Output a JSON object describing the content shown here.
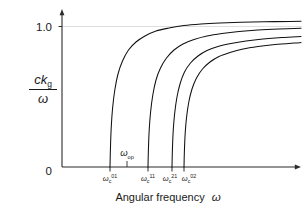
{
  "figure": {
    "background": "#ffffff",
    "ink_color": "#111111",
    "grid_color": "#dedede"
  },
  "chart_data": {
    "type": "line",
    "title": "",
    "xlabel": "Angular frequency  ω",
    "ylabel_numerator": "ck",
    "ylabel_numerator_sub": "g",
    "ylabel_denominator": "ω",
    "ylabel_plain": "ck_g / ω",
    "grid": "horizontal-at-1.0",
    "legend": "none",
    "xlim": [
      0,
      1
    ],
    "ylim": [
      0,
      1.12
    ],
    "y_ticks": [
      {
        "value": 1.0,
        "label": "1.0"
      },
      {
        "value": 0.0,
        "label": "0"
      }
    ],
    "x_ticks": [
      {
        "label_base": "ω",
        "label_sub": "c",
        "label_sup": "01",
        "plain": "ω_c^01",
        "x_px": 110
      },
      {
        "label_base": "ω",
        "label_sub": "c",
        "label_sup": "11",
        "plain": "ω_c^11",
        "x_px": 148
      },
      {
        "label_base": "ω",
        "label_sub": "c",
        "label_sup": "21",
        "plain": "ω_c^21",
        "x_px": 172
      },
      {
        "label_base": "ω",
        "label_sub": "c",
        "label_sup": "02",
        "plain": "ω_c^02",
        "x_px": 184
      }
    ],
    "annotations": [
      {
        "name": "operating-frequency-marker",
        "base": "ω",
        "sub": "op",
        "plain": "ω_op",
        "x_px": 127,
        "label_y_px": 155,
        "tick_top_px": 161,
        "tick_bottom_px": 167
      }
    ],
    "series": [
      {
        "name": "TE01 mode",
        "cutoff_label": "ω_c^01",
        "cutoff_x_px": 110,
        "asymptote": 1.0,
        "points": [
          [
            110,
            167
          ],
          [
            110.4,
            150
          ],
          [
            111.2,
            128
          ],
          [
            112.6,
            108
          ],
          [
            114.8,
            90
          ],
          [
            118,
            74
          ],
          [
            122.5,
            61
          ],
          [
            128.5,
            50
          ],
          [
            136,
            42
          ],
          [
            145,
            36
          ],
          [
            156,
            31
          ],
          [
            169,
            28
          ],
          [
            184,
            25.5
          ],
          [
            201,
            24
          ],
          [
            220,
            23
          ],
          [
            241,
            22.3
          ],
          [
            264,
            21.8
          ],
          [
            290,
            21.4
          ],
          [
            301,
            21.3
          ]
        ]
      },
      {
        "name": "TE11 mode",
        "cutoff_label": "ω_c^11",
        "cutoff_x_px": 148,
        "asymptote": 1.0,
        "points": [
          [
            148,
            167
          ],
          [
            148.4,
            150
          ],
          [
            149.2,
            130
          ],
          [
            150.6,
            112
          ],
          [
            152.8,
            95
          ],
          [
            156,
            80
          ],
          [
            160.5,
            68
          ],
          [
            166.5,
            58
          ],
          [
            174,
            50
          ],
          [
            183,
            44
          ],
          [
            194,
            39.5
          ],
          [
            207,
            36
          ],
          [
            222,
            33.5
          ],
          [
            239,
            31.5
          ],
          [
            258,
            30
          ],
          [
            279,
            29
          ],
          [
            301,
            28.3
          ]
        ]
      },
      {
        "name": "TE21 mode",
        "cutoff_label": "ω_c^21",
        "cutoff_x_px": 172,
        "asymptote": 1.0,
        "points": [
          [
            172,
            167
          ],
          [
            172.4,
            150
          ],
          [
            173.2,
            131
          ],
          [
            174.6,
            114
          ],
          [
            176.8,
            98
          ],
          [
            180,
            84
          ],
          [
            184.5,
            72
          ],
          [
            190.5,
            63
          ],
          [
            198,
            56
          ],
          [
            207,
            50.5
          ],
          [
            218,
            46.5
          ],
          [
            231,
            43.5
          ],
          [
            246,
            41
          ],
          [
            263,
            39
          ],
          [
            282,
            37.5
          ],
          [
            301,
            36.5
          ]
        ]
      },
      {
        "name": "TM02 mode",
        "cutoff_label": "ω_c^02",
        "cutoff_x_px": 184,
        "asymptote": 1.0,
        "points": [
          [
            184,
            167
          ],
          [
            184.4,
            151
          ],
          [
            185.2,
            133
          ],
          [
            186.6,
            117
          ],
          [
            188.8,
            102
          ],
          [
            192,
            89
          ],
          [
            196.5,
            78
          ],
          [
            202.5,
            69
          ],
          [
            210,
            62
          ],
          [
            219,
            56.5
          ],
          [
            230,
            52.5
          ],
          [
            243,
            49
          ],
          [
            258,
            46.5
          ],
          [
            275,
            44.5
          ],
          [
            294,
            43
          ],
          [
            301,
            42.6
          ]
        ]
      }
    ]
  },
  "axes": {
    "y_top_label": "1.0",
    "origin_label": "0",
    "x_title_text": "Angular frequency",
    "x_title_symbol": "ω"
  }
}
